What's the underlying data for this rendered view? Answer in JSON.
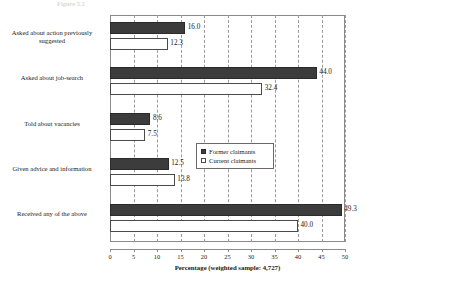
{
  "caption": {
    "text": "Figure 5.2"
  },
  "chart_data": {
    "type": "bar",
    "orientation": "horizontal",
    "title": "",
    "xlabel": "Percentage (weighted sample: 4,727)",
    "ylabel": "",
    "xlim": [
      0,
      50
    ],
    "xticks": [
      0,
      5,
      10,
      15,
      20,
      25,
      30,
      35,
      40,
      45,
      50
    ],
    "xtick_labels": [
      "0",
      "5",
      "10",
      "15",
      "20",
      "25",
      "30",
      "35",
      "40",
      "45",
      "50"
    ],
    "grid": "vertical-dashed",
    "legend_position": "inside-right-center",
    "categories": [
      "Asked about action previously suggested",
      "Asked about job-search",
      "Told about vacancies",
      "Given advice and information",
      "Received any of the above"
    ],
    "series": [
      {
        "name": "Former claimants",
        "color": "#3c3c3c",
        "style": "filled",
        "values": [
          16.0,
          44.0,
          8.6,
          12.5,
          49.3
        ],
        "labels": [
          "16.0",
          "44.0",
          "8.6",
          "12.5",
          "49.3"
        ]
      },
      {
        "name": "Current claimants",
        "color": "#ffffff",
        "style": "hollow",
        "values": [
          12.3,
          32.4,
          7.5,
          13.8,
          40.0
        ],
        "labels": [
          "12.3",
          "32.4",
          "7.5",
          "13.8",
          "40.0"
        ]
      }
    ]
  }
}
